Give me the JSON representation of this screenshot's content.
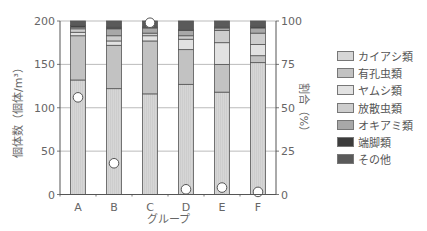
{
  "chart_data": {
    "type": "bar",
    "stacked": true,
    "title": "",
    "xlabel": "グループ",
    "ylabel": "個体数（個体/m³）",
    "y2label": "割合（%）",
    "ylim": [
      0,
      200
    ],
    "y2lim": [
      0,
      100
    ],
    "yticks": [
      0,
      50,
      100,
      150,
      200
    ],
    "y2ticks": [
      0,
      25,
      50,
      75,
      100
    ],
    "grid": true,
    "legend_position": "right",
    "categories": [
      "A",
      "B",
      "C",
      "D",
      "E",
      "F"
    ],
    "series": [
      {
        "name": "カイアシ類",
        "color": "#d6d6d6",
        "values": [
          132,
          122,
          116,
          127,
          118,
          152
        ]
      },
      {
        "name": "有孔虫類",
        "color": "#c2c2c2",
        "values": [
          51,
          50,
          61,
          40,
          32,
          8
        ]
      },
      {
        "name": "ヤムシ類",
        "color": "#e2e2e2",
        "values": [
          4,
          5,
          6,
          12,
          25,
          13
        ]
      },
      {
        "name": "放散虫類",
        "color": "#cdcdcd",
        "values": [
          4,
          6,
          3,
          4,
          14,
          13
        ]
      },
      {
        "name": "オキアミ類",
        "color": "#a8a8a8",
        "values": [
          2,
          8,
          6,
          6,
          3,
          6
        ]
      },
      {
        "name": "端脚類",
        "color": "#3c3c3c",
        "values": [
          2,
          2,
          1,
          1,
          1,
          2
        ]
      },
      {
        "name": "その他",
        "color": "#5a5a5a",
        "values": [
          5,
          7,
          7,
          10,
          7,
          6
        ]
      }
    ],
    "markers": {
      "name": "割合",
      "axis": "right",
      "shape": "open-circle",
      "values": [
        56,
        18,
        99,
        3,
        4,
        1.5
      ]
    }
  },
  "legend": {
    "items": [
      {
        "label": "カイアシ類",
        "color": "#d6d6d6"
      },
      {
        "label": "有孔虫類",
        "color": "#c2c2c2"
      },
      {
        "label": "ヤムシ類",
        "color": "#e2e2e2"
      },
      {
        "label": "放散虫類",
        "color": "#cdcdcd"
      },
      {
        "label": "オキアミ類",
        "color": "#a8a8a8"
      },
      {
        "label": "端脚類",
        "color": "#3c3c3c"
      },
      {
        "label": "その他",
        "color": "#5a5a5a"
      }
    ]
  }
}
